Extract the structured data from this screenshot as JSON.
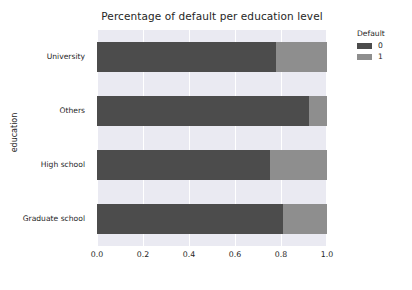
{
  "chart_data": {
    "type": "bar",
    "orientation": "horizontal",
    "stacked": true,
    "normalized": true,
    "title": "Percentage of default per education level",
    "xlabel": "",
    "ylabel": "education",
    "xlim": [
      0.0,
      1.0
    ],
    "xticks": [
      "0.0",
      "0.2",
      "0.4",
      "0.6",
      "0.8",
      "1.0"
    ],
    "xtick_values": [
      0.0,
      0.2,
      0.4,
      0.6,
      0.8,
      1.0
    ],
    "grid": true,
    "grid_color": "#ffffff",
    "plot_background": "#eaeaf2",
    "legend": {
      "title": "Default",
      "position": "right-outside",
      "entries": [
        {
          "label": "0",
          "color": "#4c4c4c"
        },
        {
          "label": "1",
          "color": "#8e8e8e"
        }
      ]
    },
    "categories": [
      "University",
      "Others",
      "High school",
      "Graduate school"
    ],
    "series": [
      {
        "name": "0",
        "color": "#4c4c4c",
        "values": [
          0.78,
          0.92,
          0.75,
          0.81
        ]
      },
      {
        "name": "1",
        "color": "#8e8e8e",
        "values": [
          0.22,
          0.08,
          0.25,
          0.19
        ]
      }
    ],
    "bars": [
      {
        "category": "University",
        "segment_0": 0.78,
        "segment_1": 0.22
      },
      {
        "category": "Others",
        "segment_0": 0.92,
        "segment_1": 0.08
      },
      {
        "category": "High school",
        "segment_0": 0.75,
        "segment_1": 0.25
      },
      {
        "category": "Graduate school",
        "segment_0": 0.81,
        "segment_1": 0.19
      }
    ]
  }
}
